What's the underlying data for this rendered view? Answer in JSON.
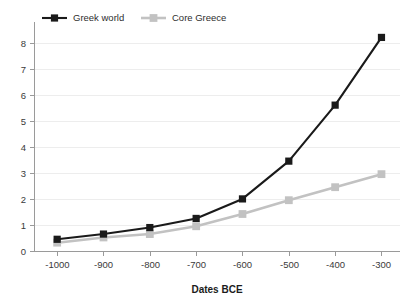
{
  "chart_data": {
    "type": "line",
    "title": "",
    "subtitle": "",
    "xlabel": "Dates BCE",
    "ylabel": "",
    "categories": [
      "-1000",
      "-900",
      "-800",
      "-700",
      "-600",
      "-500",
      "-400",
      "-300"
    ],
    "x": [
      -1000,
      -900,
      -800,
      -700,
      -600,
      -500,
      -400,
      -300
    ],
    "xlim": [
      -1050,
      -260
    ],
    "ylim": [
      0,
      8.6
    ],
    "y_ticks": [
      0,
      1,
      2,
      3,
      4,
      5,
      6,
      7,
      8
    ],
    "y_tick_labels": [
      "0",
      "1",
      "2",
      "3",
      "4",
      "5",
      "6",
      "7",
      "8"
    ],
    "x_tick_labels": [
      "-1000",
      "-900",
      "-800",
      "-700",
      "-600",
      "-500",
      "-400",
      "-300"
    ],
    "grid": "horizontal",
    "legend_position": "top-left",
    "marker": "square",
    "series": [
      {
        "name": "Greek world",
        "color": "#1a1a1a",
        "values": [
          0.45,
          0.65,
          0.9,
          1.25,
          2.0,
          3.45,
          5.6,
          8.2
        ]
      },
      {
        "name": "Core Greece",
        "color": "#c2c2c2",
        "values": [
          0.32,
          0.52,
          0.65,
          0.95,
          1.42,
          1.95,
          2.45,
          2.95
        ]
      }
    ]
  },
  "legend": {
    "items": [
      {
        "label": "Greek world",
        "color": "#1a1a1a"
      },
      {
        "label": "Core Greece",
        "color": "#c2c2c2"
      }
    ]
  },
  "axes": {
    "x_title": "Dates BCE"
  },
  "colors": {
    "series_primary": "#1a1a1a",
    "series_secondary": "#c2c2c2",
    "grid": "#ededed",
    "axis": "#9a9a9a",
    "text": "#3a3a3a",
    "title_text": "#1c1c1c",
    "background": "#ffffff"
  }
}
